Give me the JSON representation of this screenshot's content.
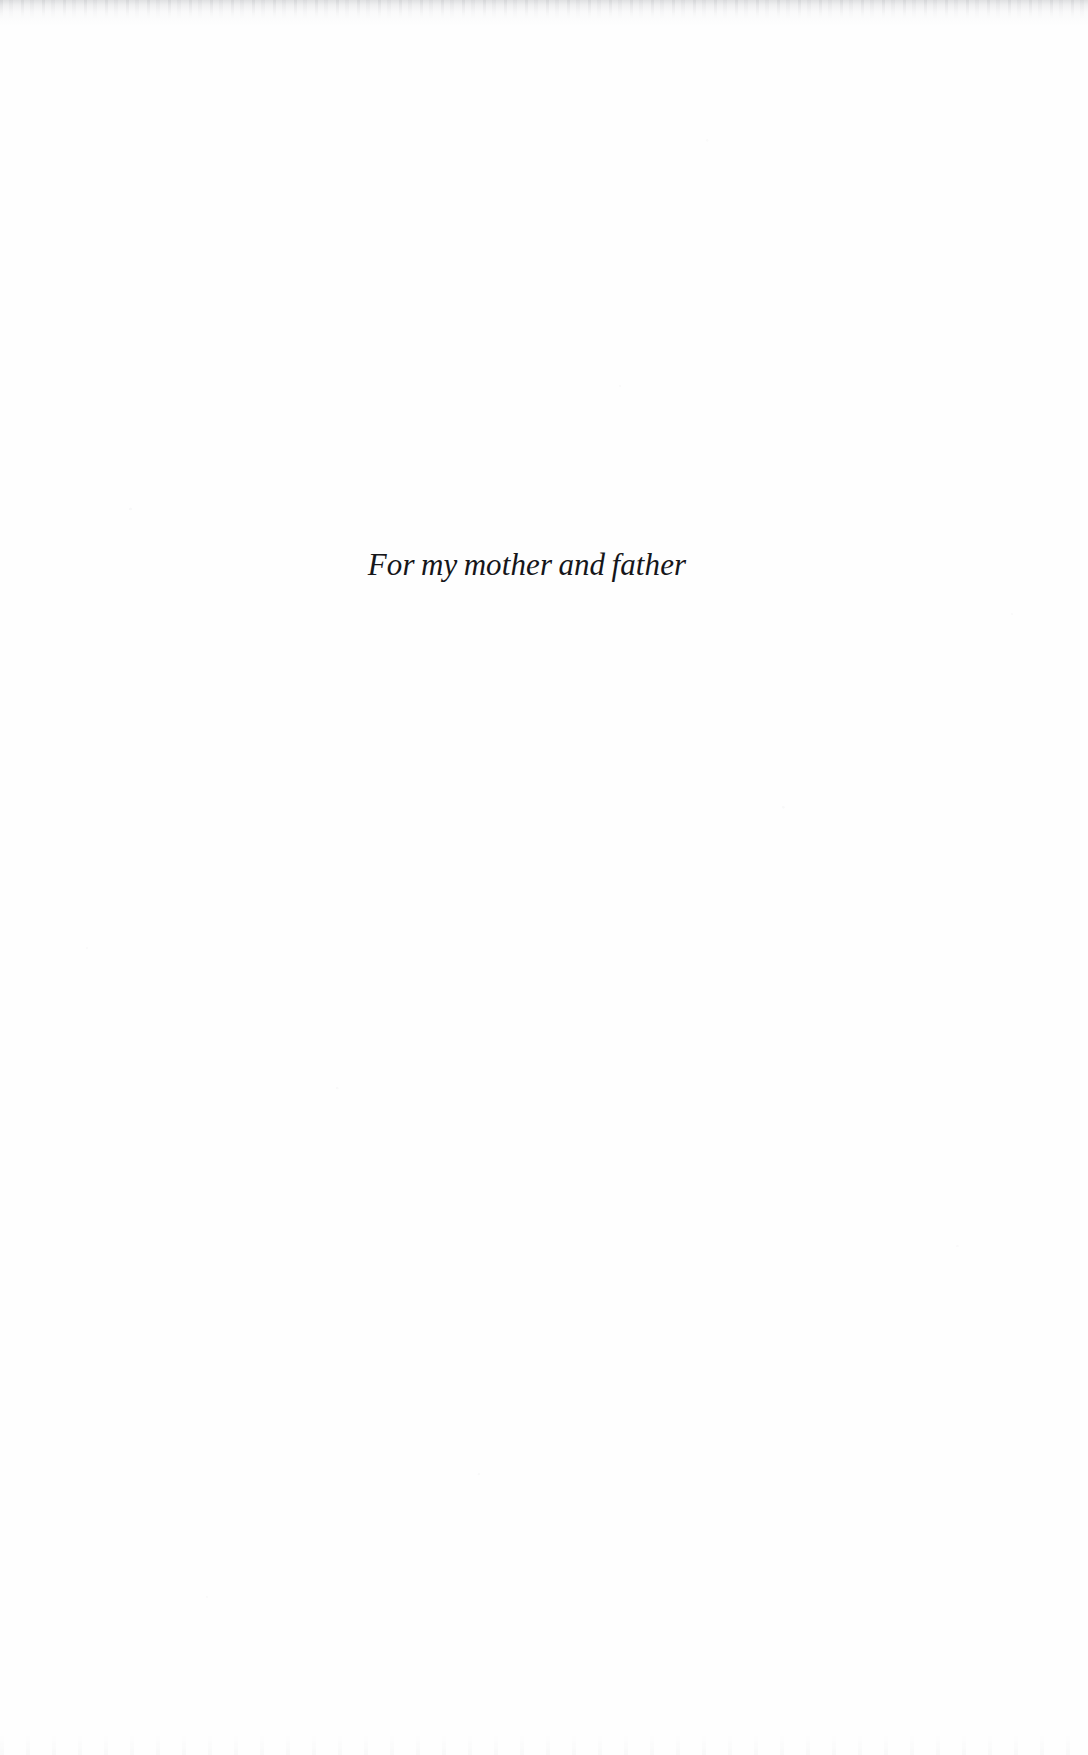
{
  "page": {
    "type": "book-dedication-page",
    "background_color": "#fefefe",
    "ink_color": "#16161a"
  },
  "dedication": {
    "text": "For my mother and father"
  }
}
